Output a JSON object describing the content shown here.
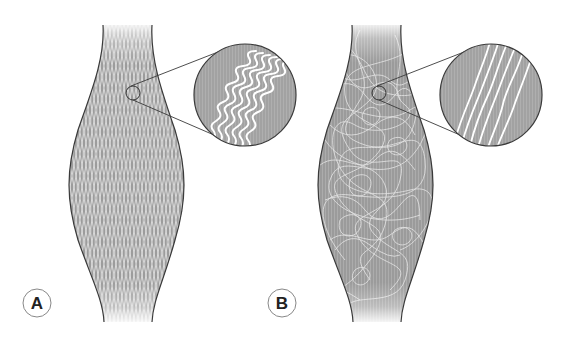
{
  "figure": {
    "colors": {
      "tissue_fill": "#9c9c9c",
      "fiber": "#ffffff",
      "outline": "#3a3a3a",
      "inset_fill": "#a2a2a2",
      "label_circle": "#888888"
    },
    "panels": [
      {
        "id": "A",
        "label": "A",
        "fiber_pattern": "regular crisscross lattice",
        "inset_pattern": "parallel wavy (crimped) fibers",
        "inset_fiber_count": 6
      },
      {
        "id": "B",
        "label": "B",
        "fiber_pattern": "random tangled fibers",
        "inset_pattern": "parallel straight fibers with slight undulation",
        "inset_fiber_count": 6
      }
    ]
  }
}
